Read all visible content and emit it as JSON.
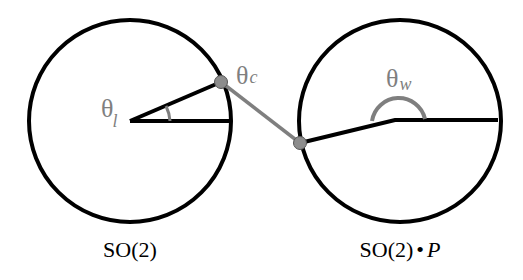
{
  "diagram": {
    "left_circle": {
      "label": "SO(2)",
      "angle_symbol": "θ",
      "angle_subscript": "l"
    },
    "connector": {
      "angle_symbol": "θ",
      "angle_subscript": "c"
    },
    "right_circle": {
      "label_main": "SO(2)",
      "label_dot": "•",
      "label_italic": "P",
      "angle_symbol": "θ",
      "angle_subscript": "w"
    },
    "colors": {
      "stroke": "#000000",
      "accent_gray": "#7f7f7f",
      "joint_fill": "#8c8c8c",
      "background": "#ffffff"
    }
  }
}
